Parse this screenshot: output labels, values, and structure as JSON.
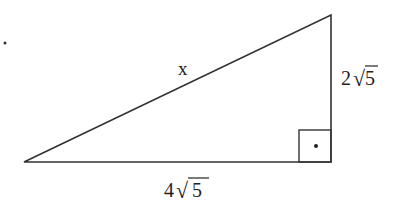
{
  "diagram": {
    "type": "right-triangle",
    "labels": {
      "hypotenuse": "x",
      "vertical_leg_coef": "2",
      "vertical_leg_rad": "5",
      "horizontal_leg_coef": "4",
      "horizontal_leg_rad": "5",
      "sqrt_symbol": "√"
    },
    "stray_mark": "·",
    "colors": {
      "stroke": "#333333",
      "text": "#222222"
    }
  }
}
